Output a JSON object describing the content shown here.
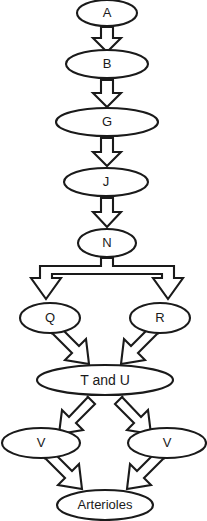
{
  "diagram": {
    "background_color": "#ffffff",
    "stroke_color": "#1a1a1a",
    "fill_color": "#ffffff",
    "nodes": [
      {
        "id": "a",
        "label": "A",
        "cx": 107,
        "cy": 13,
        "rx": 30,
        "ry": 13,
        "font_size": 13
      },
      {
        "id": "b",
        "label": "B",
        "cx": 107,
        "cy": 64,
        "rx": 41,
        "ry": 14,
        "font_size": 13
      },
      {
        "id": "g",
        "label": "G",
        "cx": 107,
        "cy": 122,
        "rx": 51,
        "ry": 14,
        "font_size": 13
      },
      {
        "id": "j",
        "label": "J",
        "cx": 106,
        "cy": 182,
        "rx": 42,
        "ry": 14,
        "font_size": 13
      },
      {
        "id": "n",
        "label": "N",
        "cx": 107,
        "cy": 243,
        "rx": 29,
        "ry": 14,
        "font_size": 13
      },
      {
        "id": "q",
        "label": "Q",
        "cx": 50,
        "cy": 318,
        "rx": 30,
        "ry": 15,
        "font_size": 13
      },
      {
        "id": "r",
        "label": "R",
        "cx": 160,
        "cy": 318,
        "rx": 30,
        "ry": 15,
        "font_size": 13
      },
      {
        "id": "tu",
        "label": "T and U",
        "cx": 105,
        "cy": 380,
        "rx": 68,
        "ry": 15,
        "font_size": 14
      },
      {
        "id": "v1",
        "label": "V",
        "cx": 41,
        "cy": 443,
        "rx": 39,
        "ry": 15,
        "font_size": 13
      },
      {
        "id": "v2",
        "label": "V",
        "cx": 167,
        "cy": 443,
        "rx": 39,
        "ry": 15,
        "font_size": 13
      },
      {
        "id": "art",
        "label": "Arterioles",
        "cx": 105,
        "cy": 505,
        "rx": 48,
        "ry": 15,
        "font_size": 13
      }
    ],
    "connectors": [
      {
        "id": "a-to-b",
        "from": "a",
        "to": "b",
        "kind": "block-arrow-down"
      },
      {
        "id": "b-to-g",
        "from": "b",
        "to": "g",
        "kind": "block-arrow-down"
      },
      {
        "id": "g-to-j",
        "from": "g",
        "to": "j",
        "kind": "block-arrow-down"
      },
      {
        "id": "j-to-n",
        "from": "j",
        "to": "n",
        "kind": "block-arrow-down"
      },
      {
        "id": "n-to-qr",
        "from": "n",
        "to": "q,r",
        "kind": "block-fork-split"
      },
      {
        "id": "q-to-tu",
        "from": "q",
        "to": "tu",
        "kind": "block-arrow-diagonal-right"
      },
      {
        "id": "r-to-tu",
        "from": "r",
        "to": "tu",
        "kind": "block-arrow-diagonal-left"
      },
      {
        "id": "tu-to-v1",
        "from": "tu",
        "to": "v1",
        "kind": "block-arrow-diagonal-left"
      },
      {
        "id": "tu-to-v2",
        "from": "tu",
        "to": "v2",
        "kind": "block-arrow-diagonal-right"
      },
      {
        "id": "v1-to-art",
        "from": "v1",
        "to": "art",
        "kind": "block-arrow-diagonal-right"
      },
      {
        "id": "v2-to-art",
        "from": "v2",
        "to": "art",
        "kind": "block-arrow-diagonal-left"
      }
    ]
  }
}
